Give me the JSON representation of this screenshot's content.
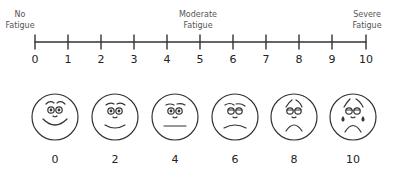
{
  "scale": {
    "anchors": {
      "left": {
        "line1": "No",
        "line2": "Fatigue"
      },
      "middle": {
        "line1": "Moderate",
        "line2": "Fatigue"
      },
      "right": {
        "line1": "Severe",
        "line2": "Fatigue"
      }
    },
    "ticks": [
      "0",
      "1",
      "2",
      "3",
      "4",
      "5",
      "6",
      "7",
      "8",
      "9",
      "10"
    ],
    "faces": [
      {
        "value": "0",
        "expression": "very-happy"
      },
      {
        "value": "2",
        "expression": "happy"
      },
      {
        "value": "4",
        "expression": "neutral"
      },
      {
        "value": "6",
        "expression": "sad"
      },
      {
        "value": "8",
        "expression": "very-sad"
      },
      {
        "value": "10",
        "expression": "crying"
      }
    ],
    "line_color": "#333333",
    "label_color": "#555555"
  }
}
